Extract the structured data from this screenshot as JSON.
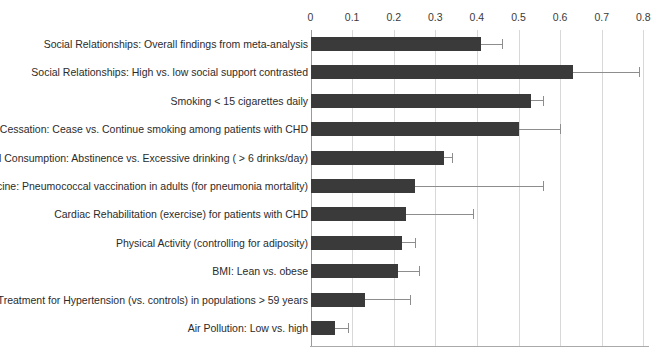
{
  "chart_data": {
    "type": "bar",
    "orientation": "horizontal",
    "title": "",
    "xlabel": "",
    "ylabel": "",
    "xlim": [
      0,
      0.8
    ],
    "grid": true,
    "legend": "none",
    "xticks": [
      "0",
      "0.1",
      "0.2",
      "0.3",
      "0.4",
      "0.5",
      "0.6",
      "0.7",
      "0.8"
    ],
    "xtick_values": [
      0,
      0.1,
      0.2,
      0.3,
      0.4,
      0.5,
      0.6,
      0.7,
      0.8
    ],
    "categories": [
      "Social Relationships: Overall findings from meta-analysis",
      "Social Relationships: High vs. low social support contrasted",
      "Smoking < 15 cigarettes daily",
      "Smoking Cessation: Cease vs. Continue smoking among patients with CHD",
      "Alcohol Consumption: Abstinence vs. Excessive drinking ( > 6 drinks/day)",
      "Flu Vaccine: Pneumococcal vaccination in adults (for pneumonia mortality)",
      "Cardiac Rehabilitation (exercise) for patients with CHD",
      "Physical Activity (controlling for adiposity)",
      "BMI: Lean vs. obese",
      "Drug Treatment for Hypertension (vs. controls) in populations > 59 years",
      "Air Pollution: Low vs. high"
    ],
    "values": [
      0.41,
      0.63,
      0.53,
      0.5,
      0.32,
      0.25,
      0.23,
      0.22,
      0.21,
      0.13,
      0.06
    ],
    "error_upper": [
      0.46,
      0.79,
      0.56,
      0.6,
      0.34,
      0.56,
      0.39,
      0.25,
      0.26,
      0.24,
      0.09
    ],
    "bar_color": "#3a3a3a",
    "error_color": "#8d8d8d",
    "gridline_color": "#d8d8d8"
  }
}
